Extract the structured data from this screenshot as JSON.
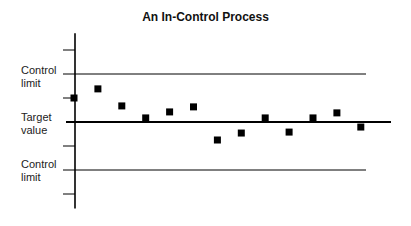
{
  "chart_data": {
    "type": "scatter",
    "title": "An In-Control Process",
    "xlabel": "",
    "ylabel": "",
    "y_labels": [
      {
        "text": [
          "Control",
          "limit"
        ],
        "value": 2
      },
      {
        "text": [
          "Target",
          "value"
        ],
        "value": 0
      },
      {
        "text": [
          "Control",
          "limit"
        ],
        "value": -2
      }
    ],
    "reference_lines": [
      {
        "name": "Upper control limit",
        "value": 2
      },
      {
        "name": "Target value",
        "value": 0
      },
      {
        "name": "Lower control limit",
        "value": -2
      }
    ],
    "y_ticks": [
      3,
      2,
      1,
      0,
      -1,
      -2,
      -3
    ],
    "ylim": [
      -3.6,
      3.7
    ],
    "x": [
      1,
      2,
      3,
      4,
      5,
      6,
      7,
      8,
      9,
      10,
      11,
      12,
      13
    ],
    "values": [
      1.0,
      1.38,
      0.67,
      0.17,
      0.42,
      0.63,
      -0.75,
      -0.46,
      0.17,
      -0.42,
      0.17,
      0.38,
      -0.21
    ],
    "grid": false,
    "legend": null
  },
  "colors": {
    "points": "#000000",
    "lines": "#000000",
    "background": "#ffffff"
  }
}
